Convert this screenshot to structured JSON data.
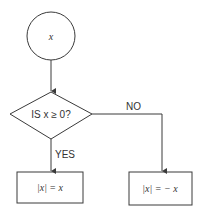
{
  "diagram": {
    "type": "flowchart",
    "nodes": {
      "start": {
        "shape": "circle",
        "text": "x"
      },
      "decision": {
        "shape": "diamond",
        "text": "IS  x ≥ 0?"
      },
      "yes_result": {
        "shape": "rectangle",
        "text": "|x| =  x"
      },
      "no_result": {
        "shape": "rectangle",
        "text": "|x| = − x"
      }
    },
    "edges": [
      {
        "from": "start",
        "to": "decision",
        "label": ""
      },
      {
        "from": "decision",
        "to": "yes_result",
        "label": "YES"
      },
      {
        "from": "decision",
        "to": "no_result",
        "label": "NO"
      }
    ],
    "colors": {
      "stroke": "#3a3a3a",
      "text": "#333333",
      "background": "#ffffff"
    }
  }
}
